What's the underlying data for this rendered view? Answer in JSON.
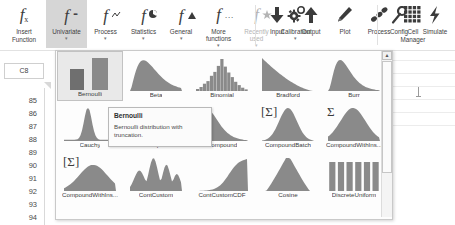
{
  "ribbon": {
    "groups": [
      {
        "name": "function-library",
        "buttons": [
          {
            "id": "insert-function",
            "label": "Insert\nFunction",
            "icon": "fx-icon",
            "caret": false,
            "selected": false,
            "disabled": false
          },
          {
            "id": "univariate",
            "label": "Univariate",
            "icon": "f-univariate-icon",
            "caret": true,
            "selected": true,
            "disabled": false
          },
          {
            "id": "process",
            "label": "Process",
            "icon": "f-process-icon",
            "caret": true,
            "selected": false,
            "disabled": false
          },
          {
            "id": "statistics",
            "label": "Statistics",
            "icon": "f-statistics-icon",
            "caret": true,
            "selected": false,
            "disabled": false
          },
          {
            "id": "general",
            "label": "General",
            "icon": "f-general-icon",
            "caret": true,
            "selected": false,
            "disabled": false
          },
          {
            "id": "more-functions",
            "label": "More\nfunctions",
            "icon": "f-more-icon",
            "caret": true,
            "selected": false,
            "disabled": false
          },
          {
            "id": "recently-used",
            "label": "Recently\nused",
            "icon": "f-recent-icon",
            "caret": true,
            "selected": false,
            "disabled": true
          },
          {
            "id": "calibration",
            "label": "Calibration",
            "icon": "gear-icon",
            "caret": true,
            "selected": false,
            "disabled": false
          }
        ]
      },
      {
        "name": "model-group",
        "buttons": [
          {
            "id": "input",
            "label": "Input",
            "icon": "arrow-down-icon",
            "caret": false,
            "selected": false,
            "disabled": false
          },
          {
            "id": "output",
            "label": "Output",
            "icon": "arrow-up-icon",
            "caret": false,
            "selected": false,
            "disabled": false
          },
          {
            "id": "plot",
            "label": "Plot",
            "icon": "pencil-icon",
            "caret": false,
            "selected": false,
            "disabled": false
          },
          {
            "id": "process-btn",
            "label": "Process",
            "icon": "beans-icon",
            "caret": false,
            "selected": false,
            "disabled": false
          },
          {
            "id": "cell-manager",
            "label": "Cell\nManager",
            "icon": "grid-icon",
            "caret": false,
            "selected": false,
            "disabled": false
          }
        ]
      },
      {
        "name": "run-group",
        "buttons": [
          {
            "id": "config",
            "label": "Config",
            "icon": "wrench-icon",
            "caret": false,
            "selected": false,
            "disabled": false
          },
          {
            "id": "simulate",
            "label": "Simulate",
            "icon": "lightning-icon",
            "caret": false,
            "selected": false,
            "disabled": false
          }
        ]
      }
    ]
  },
  "sheet": {
    "name_box_value": "C8",
    "row_headers": [
      "85",
      "86",
      "87",
      "88",
      "89",
      "90",
      "91",
      "92",
      "93",
      "94"
    ]
  },
  "gallery": {
    "scroll_up_glyph": "▲",
    "rows": [
      [
        {
          "id": "bernoulli",
          "label": "Bernoulli",
          "shape": "two-bars",
          "badge": "",
          "selected": true
        },
        {
          "id": "beta",
          "label": "Beta",
          "shape": "right-skew",
          "badge": "",
          "selected": false
        },
        {
          "id": "binomial",
          "label": "Binomial",
          "shape": "histogram",
          "badge": "",
          "selected": false
        },
        {
          "id": "bradford",
          "label": "Bradford",
          "shape": "decay",
          "badge": "",
          "selected": false
        },
        {
          "id": "burr",
          "label": "Burr",
          "shape": "sharp-peak",
          "badge": "",
          "selected": false
        }
      ],
      [
        {
          "id": "cauchy",
          "label": "Cauchy",
          "shape": "narrow-peak",
          "badge": "",
          "selected": false
        },
        {
          "id": "chisquare",
          "label": "ChiSquare",
          "shape": "right-skew",
          "badge": "",
          "selected": false
        },
        {
          "id": "compound",
          "label": "Compound",
          "shape": "sharp-peak",
          "badge": "",
          "selected": false
        },
        {
          "id": "compoundbatch",
          "label": "CompoundBatch",
          "shape": "bell",
          "badge": "[Σ]",
          "selected": false
        },
        {
          "id": "compoundwithins",
          "label": "CompoundWithIns...",
          "shape": "wide-bell",
          "badge": "Σ",
          "selected": false
        }
      ],
      [
        {
          "id": "compoundwithins2",
          "label": "CompoundWithIns...",
          "shape": "left-skew-bell",
          "badge": "[Σ]",
          "selected": false
        },
        {
          "id": "contcustom",
          "label": "ContCustom",
          "shape": "multimodal",
          "badge": "",
          "selected": false
        },
        {
          "id": "contcustomcdf",
          "label": "ContCustomCDF",
          "shape": "cdf",
          "badge": "",
          "selected": false
        },
        {
          "id": "cosine",
          "label": "Cosine",
          "shape": "triangle-bell",
          "badge": "",
          "selected": false
        },
        {
          "id": "discreteuniform",
          "label": "DiscreteUniform",
          "shape": "uniform-bars",
          "badge": "",
          "selected": false
        }
      ]
    ]
  },
  "tooltip": {
    "title": "Bernoulli",
    "description": "Bernoulli distribution with truncation."
  },
  "colors": {
    "chart_fill": "#8a8a8a",
    "chart_fill_dark": "#6f6f6f",
    "selection_bg": "#d6d6d6",
    "panel_bg": "#fdfdfd",
    "border": "#c9c9c9"
  }
}
